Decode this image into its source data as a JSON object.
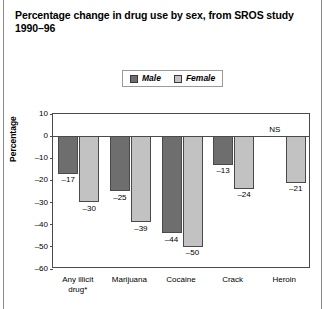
{
  "chart_data": {
    "type": "bar",
    "title": "Percentage change in drug use by sex, from SROS study 1990–96",
    "xlabel": "",
    "ylabel": "Percentage",
    "ylim": [
      -60,
      10
    ],
    "yticks": [
      10,
      0,
      -10,
      -20,
      -30,
      -40,
      -50,
      -60
    ],
    "ytick_labels": [
      "10",
      "0",
      "–10",
      "–20",
      "–30",
      "–40",
      "–50",
      "–60"
    ],
    "grid": false,
    "legend_position": "top-center",
    "categories": [
      "Any illicit\ndrug*",
      "Marijuana",
      "Cocaine",
      "Crack",
      "Heroin"
    ],
    "series": [
      {
        "name": "Male",
        "color": "#6e6e6e",
        "values": [
          -17,
          -25,
          -44,
          -13,
          null
        ],
        "labels": [
          "–17",
          "–25",
          "–44",
          "–13",
          "NS"
        ]
      },
      {
        "name": "Female",
        "color": "#c2c2c2",
        "values": [
          -30,
          -39,
          -50,
          -24,
          -21
        ],
        "labels": [
          "–30",
          "–39",
          "–50",
          "–24",
          "–21"
        ]
      }
    ],
    "annotations": [
      "NS"
    ]
  },
  "title": {
    "line1": "Percentage change in drug use by sex, from SROS study",
    "line2": "1990–96"
  },
  "legend": {
    "items": [
      {
        "label": "Male",
        "color": "#6e6e6e"
      },
      {
        "label": "Female",
        "color": "#c2c2c2"
      }
    ]
  },
  "axis": {
    "y_title": "Percentage"
  }
}
